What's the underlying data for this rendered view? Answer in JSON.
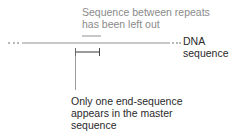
{
  "diagram": {
    "top_annotation": {
      "line1": "Sequence between repeats",
      "line2": "has been left out"
    },
    "dna_label": {
      "line1": "DNA",
      "line2": "sequence"
    },
    "bottom_annotation": {
      "line1": "Only one end-sequence",
      "line2": "appears in the master",
      "line3": "sequence"
    },
    "colors": {
      "line": "#c8c8c8",
      "text": "#2a2a2a",
      "muted_text": "#8a8a8a"
    }
  }
}
